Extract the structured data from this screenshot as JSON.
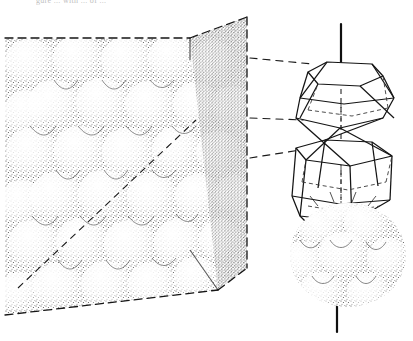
{
  "figure": {
    "title_fragment": "gure ... with ... of ...",
    "ink_color": "#1a1a1a",
    "stipple_color": "#2b2b2b",
    "background": "#ffffff"
  },
  "cube": {
    "label": "close-packed sphere cube",
    "top_front_left": [
      5,
      38
    ],
    "top_front_right": [
      190,
      38
    ],
    "top_back_right": [
      247,
      17
    ],
    "bottom_front_left": [
      5,
      315
    ],
    "bottom_front_right": [
      218,
      290
    ],
    "bottom_back_right": [
      247,
      268
    ],
    "edge_style": "dashed",
    "face_texture": "stipple"
  },
  "leaders": {
    "label": "dashed leader lines",
    "count": 3,
    "lines": [
      {
        "x1": 250,
        "y1": 58,
        "x2": 312,
        "y2": 64
      },
      {
        "x1": 250,
        "y1": 118,
        "x2": 303,
        "y2": 120
      },
      {
        "x1": 250,
        "y1": 158,
        "x2": 300,
        "y2": 150
      }
    ]
  },
  "polyhedron": {
    "label": "coordination polyhedron",
    "shape": "stacked hexagonal antiprism pair",
    "axis": {
      "x": 341,
      "y_top": 24,
      "y_bottom": 332,
      "label": "c-axis"
    },
    "upper": {
      "top_y": 62,
      "mid_y": 108,
      "label": "upper polyhedron"
    },
    "lower": {
      "top_y": 140,
      "mid_y": 196,
      "label": "lower polyhedron"
    }
  },
  "sphere_cluster": {
    "label": "stippled sphere cluster",
    "center": [
      348,
      255
    ],
    "sphere_count": 9
  }
}
